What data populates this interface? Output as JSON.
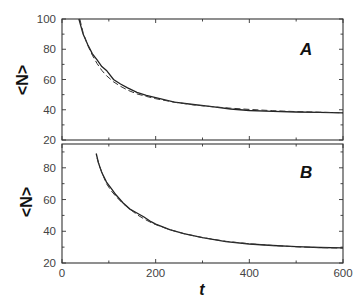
{
  "chart_data": [
    {
      "type": "line",
      "panel_label": "A",
      "xlabel": "t",
      "ylabel": "<N>",
      "xlim": [
        0,
        600
      ],
      "ylim": [
        20,
        100
      ],
      "xticks": [
        0,
        200,
        400,
        600
      ],
      "xtick_labels_shown": false,
      "yticks": [
        20,
        40,
        60,
        80,
        100
      ],
      "ytick_labels": [
        "20",
        "40",
        "60",
        "80",
        "100"
      ],
      "grid": false,
      "legend": null,
      "series": [
        {
          "name": "simulation",
          "style": "solid",
          "x": [
            36,
            45,
            55,
            65,
            75,
            85,
            95,
            110,
            125,
            140,
            160,
            180,
            200,
            240,
            280,
            320,
            360,
            400,
            450,
            500,
            550,
            600
          ],
          "y": [
            100,
            90,
            83,
            77,
            73,
            68.5,
            66,
            60,
            57,
            54.5,
            51.5,
            49.5,
            48,
            45,
            43.5,
            42,
            40.5,
            39.5,
            39,
            38.5,
            38.3,
            38
          ]
        },
        {
          "name": "fit",
          "style": "dashed",
          "x": [
            38,
            45,
            55,
            65,
            75,
            85,
            95,
            110,
            125,
            140,
            160,
            180,
            200,
            240,
            280,
            320,
            360,
            400,
            450,
            500,
            550,
            600
          ],
          "y": [
            100,
            91,
            82.5,
            76,
            70.5,
            66,
            62.5,
            58.5,
            55.5,
            53,
            50.5,
            48.8,
            47.3,
            45,
            43.3,
            42,
            41,
            40.2,
            39.4,
            38.8,
            38.4,
            38
          ]
        }
      ]
    },
    {
      "type": "line",
      "panel_label": "B",
      "xlabel": "t",
      "ylabel": "<N>",
      "xlim": [
        0,
        600
      ],
      "ylim": [
        20,
        95
      ],
      "xticks": [
        0,
        200,
        400,
        600
      ],
      "xtick_labels": [
        "0",
        "200",
        "400",
        "600"
      ],
      "yticks": [
        20,
        40,
        60,
        80
      ],
      "ytick_labels": [
        "20",
        "40",
        "60",
        "80"
      ],
      "grid": false,
      "legend": null,
      "series": [
        {
          "name": "simulation",
          "style": "solid",
          "x": [
            73,
            78,
            85,
            95,
            105,
            115,
            130,
            145,
            160,
            175,
            190,
            200,
            230,
            260,
            300,
            350,
            400,
            450,
            500,
            550,
            600
          ],
          "y": [
            89,
            83,
            77,
            71,
            67,
            63,
            58,
            54,
            51.5,
            49,
            46,
            44.5,
            41,
            38.5,
            36,
            33.5,
            32,
            31,
            30.3,
            29.8,
            29.5
          ]
        },
        {
          "name": "fit",
          "style": "dashed",
          "x": [
            75,
            80,
            88,
            95,
            105,
            115,
            130,
            145,
            160,
            175,
            190,
            200,
            230,
            260,
            300,
            350,
            400,
            450,
            500,
            550,
            600
          ],
          "y": [
            86,
            81,
            75,
            70,
            65.5,
            62,
            57.5,
            54,
            50.5,
            47.8,
            45.5,
            44.2,
            41,
            38.5,
            36,
            33.7,
            32.1,
            31,
            30.2,
            29.7,
            29.4
          ]
        }
      ]
    }
  ]
}
